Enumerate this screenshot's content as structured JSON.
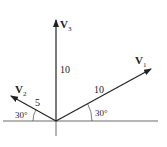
{
  "diagram": {
    "vectors": [
      {
        "name": "V",
        "subscript": "1",
        "magnitude": "10",
        "angle_label": "30°"
      },
      {
        "name": "V",
        "subscript": "2",
        "magnitude": "5",
        "angle_label": "30°"
      },
      {
        "name": "V",
        "subscript": "3",
        "magnitude": "10"
      }
    ],
    "colors": {
      "line": "#222222",
      "background": "#ffffff"
    }
  }
}
